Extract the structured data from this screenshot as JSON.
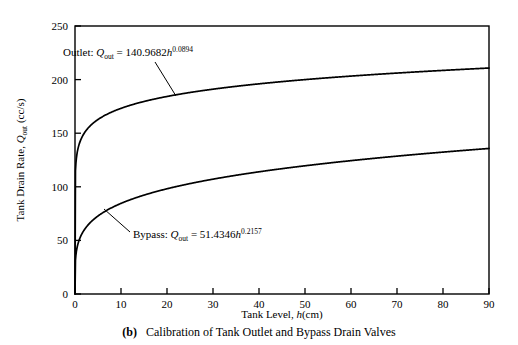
{
  "figure": {
    "caption_label": "(b)",
    "caption_text": "Calibration of Tank Outlet and Bypass Drain Valves"
  },
  "chart_data": {
    "type": "line",
    "title": "",
    "subtitle": "",
    "xlabel_parts": {
      "lead": "Tank Level, ",
      "var": "h",
      "unit": "(cm)"
    },
    "xlabel": "Tank Level, h(cm)",
    "ylabel_parts": {
      "lead": "Tank Drain Rate, ",
      "var": "Q",
      "sub": "out",
      "unit": " (cc/s)"
    },
    "ylabel": "Tank Drain Rate, Q_out (cc/s)",
    "xlim": [
      0,
      90
    ],
    "ylim": [
      0,
      250
    ],
    "xticks": [
      0,
      10,
      20,
      30,
      40,
      50,
      60,
      70,
      80,
      90
    ],
    "yticks": [
      0,
      50,
      100,
      150,
      200,
      250
    ],
    "xtick_labels": [
      "0",
      "10",
      "20",
      "30",
      "40",
      "50",
      "60",
      "70",
      "80",
      "90"
    ],
    "ytick_labels": [
      "0",
      "50",
      "100",
      "150",
      "200",
      "250"
    ],
    "grid": false,
    "legend_position": "none",
    "line_color": "#000000",
    "axis_color": "#000000",
    "background_color": "#ffffff",
    "series": [
      {
        "name": "Outlet",
        "model": "power",
        "coefficient": 140.9682,
        "exponent": 0.0894,
        "equation_text": "Outlet: Q_out = 140.9682h^0.0894",
        "label_parts": {
          "lead": "Outlet: ",
          "var": "Q",
          "sub": "out",
          "eq": " = 140.9682",
          "base": "h",
          "sup": "0.0894"
        },
        "x": [
          0,
          0.5,
          1,
          2,
          5,
          10,
          15,
          20,
          25,
          30,
          35,
          40,
          45,
          50,
          55,
          60,
          65,
          70,
          75,
          80,
          85,
          90
        ],
        "y": [
          0,
          132.6,
          141.0,
          150.0,
          163.1,
          173.4,
          179.8,
          184.5,
          188.2,
          191.3,
          193.9,
          196.2,
          198.2,
          200.1,
          201.7,
          203.3,
          204.7,
          206.0,
          207.2,
          208.4,
          209.5,
          210.5
        ]
      },
      {
        "name": "Bypass",
        "model": "power",
        "coefficient": 51.4346,
        "exponent": 0.2157,
        "equation_text": "Bypass: Q_out = 51.4346h^0.2157",
        "label_parts": {
          "lead": "Bypass: ",
          "var": "Q",
          "sub": "out",
          "eq": " = 51.4346",
          "base": "h",
          "sup": "0.2157"
        },
        "x": [
          0,
          0.5,
          1,
          2,
          5,
          10,
          15,
          20,
          25,
          30,
          35,
          40,
          45,
          50,
          55,
          60,
          65,
          70,
          75,
          80,
          85,
          90
        ],
        "y": [
          0,
          44.3,
          51.4,
          59.7,
          73.7,
          85.6,
          94.0,
          99.5,
          104.2,
          108.1,
          111.5,
          114.5,
          117.1,
          119.6,
          121.8,
          123.9,
          125.8,
          127.6,
          129.3,
          130.9,
          132.4,
          133.8
        ]
      }
    ],
    "annotations": [
      {
        "name": "outlet-equation",
        "text": "Outlet: Q_out = 140.9682h^0.0894",
        "text_x": 63,
        "text_y": 56,
        "leader_from": [
          155,
          62
        ],
        "leader_to": [
          176,
          96
        ]
      },
      {
        "name": "bypass-equation",
        "text": "Bypass: Q_out = 51.4346h^0.2157",
        "text_x": 133,
        "text_y": 238,
        "leader_from": [
          104,
          209
        ],
        "leader_to": [
          130,
          232
        ]
      }
    ]
  }
}
